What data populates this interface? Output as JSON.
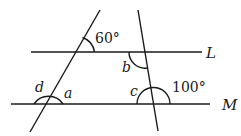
{
  "diagram": {
    "lines": {
      "L": {
        "label": "L"
      },
      "M": {
        "label": "M"
      }
    },
    "angles": {
      "given_top": "60°",
      "given_bottom": "100°",
      "a": "a",
      "b": "b",
      "c": "c",
      "d": "d"
    },
    "stroke_color": "#1a1a1a",
    "background": "#ffffff"
  }
}
